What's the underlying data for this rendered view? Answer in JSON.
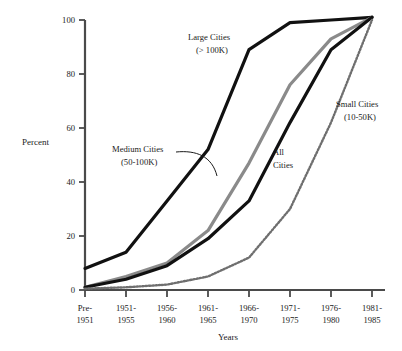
{
  "chart_data": {
    "type": "line",
    "title": "",
    "xlabel": "Years",
    "ylabel": "Percent",
    "ylim": [
      0,
      100
    ],
    "yticks": [
      0,
      20,
      40,
      60,
      80,
      100
    ],
    "grid": false,
    "legend_position": "inline-annotations",
    "categories": [
      "Pre-\n1951",
      "1951-\n1955",
      "1956-\n1960",
      "1961-\n1965",
      "1966-\n1970",
      "1971-\n1975",
      "1976-\n1980",
      "1981-\n1985"
    ],
    "category_lines": [
      [
        "Pre-",
        "1951"
      ],
      [
        "1951-",
        "1955"
      ],
      [
        "1956-",
        "1960"
      ],
      [
        "1961-",
        "1965"
      ],
      [
        "1966-",
        "1970"
      ],
      [
        "1971-",
        "1975"
      ],
      [
        "1976-",
        "1980"
      ],
      [
        "1981-",
        "1985"
      ]
    ],
    "series": [
      {
        "name": "Large Cities",
        "sublabel": "(> 100K)",
        "style": "thick-solid-black",
        "color": "#111111",
        "values": [
          8,
          14,
          33,
          52,
          89,
          99,
          100,
          101
        ]
      },
      {
        "name": "Medium Cities",
        "sublabel": "(50-100K)",
        "style": "thick-solid-gray",
        "color": "#8a8a8a",
        "values": [
          1,
          5,
          10,
          22,
          47,
          76,
          93,
          101
        ]
      },
      {
        "name": "All Cities",
        "sublabel": "",
        "style": "thick-solid-black",
        "color": "#111111",
        "values": [
          1,
          4,
          9,
          19,
          33,
          62,
          89,
          101
        ]
      },
      {
        "name": "Small Cities",
        "sublabel": "(10-50K)",
        "style": "dotted-beaded",
        "color": "#6f6f6f",
        "values": [
          0.5,
          1,
          2,
          5,
          12,
          30,
          62,
          100
        ]
      }
    ],
    "annotations": [
      {
        "id": "large-cities",
        "line1": "Large Cities",
        "line2": "(> 100K)"
      },
      {
        "id": "medium-cities",
        "line1": "Medium Cities",
        "line2": "(50-100K)"
      },
      {
        "id": "all-cities",
        "line1": "All",
        "line2": "Cities"
      },
      {
        "id": "small-cities",
        "line1": "Small Cities",
        "line2": "(10-50K)"
      }
    ],
    "ytick_labels": [
      "0",
      "20",
      "40",
      "60",
      "80",
      "100"
    ],
    "colors": {
      "axis": "#4a4a4a",
      "black_series": "#111111",
      "gray_series": "#8a8a8a",
      "dotted_series": "#6f6f6f",
      "background": "#ffffff"
    }
  }
}
